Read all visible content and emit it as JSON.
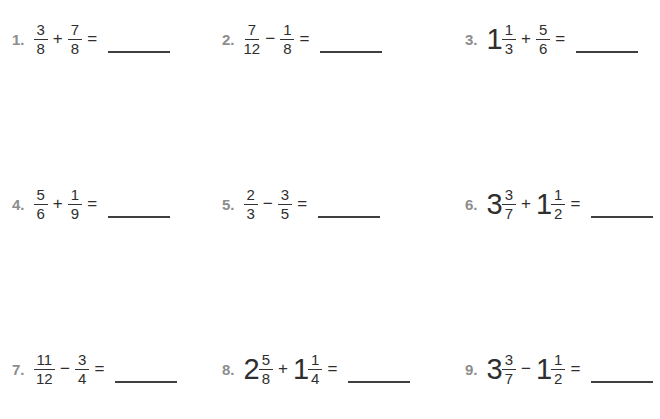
{
  "page": {
    "background": "#ffffff",
    "number_color": "#8d8d8d",
    "text_color": "#2e2e2e",
    "line_color": "#3f3f3f"
  },
  "problems": [
    {
      "number": "1.",
      "num1": "3",
      "den1": "8",
      "op": "+",
      "num2": "7",
      "den2": "8",
      "equals": "="
    },
    {
      "number": "2.",
      "num1": "7",
      "den1": "12",
      "op": "−",
      "num2": "1",
      "den2": "8",
      "equals": "="
    },
    {
      "number": "3.",
      "whole1": "1",
      "num1": "1",
      "den1": "3",
      "op": "+",
      "num2": "5",
      "den2": "6",
      "equals": "="
    },
    {
      "number": "4.",
      "num1": "5",
      "den1": "6",
      "op": "+",
      "num2": "1",
      "den2": "9",
      "equals": "="
    },
    {
      "number": "5.",
      "num1": "2",
      "den1": "3",
      "op": "−",
      "num2": "3",
      "den2": "5",
      "equals": "="
    },
    {
      "number": "6.",
      "whole1": "3",
      "num1": "3",
      "den1": "7",
      "op": "+",
      "whole2": "1",
      "num2": "1",
      "den2": "2",
      "equals": "="
    },
    {
      "number": "7.",
      "num1": "11",
      "den1": "12",
      "op": "−",
      "num2": "3",
      "den2": "4",
      "equals": "="
    },
    {
      "number": "8.",
      "whole1": "2",
      "num1": "5",
      "den1": "8",
      "op": "+",
      "whole2": "1",
      "num2": "1",
      "den2": "4",
      "equals": "="
    },
    {
      "number": "9.",
      "whole1": "3",
      "num1": "3",
      "den1": "7",
      "op": "−",
      "whole2": "1",
      "num2": "1",
      "den2": "2",
      "equals": "="
    }
  ]
}
